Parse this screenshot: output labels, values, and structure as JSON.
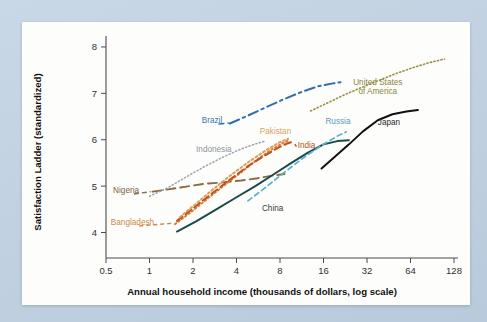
{
  "figure": {
    "background_color": "#c3d3e3",
    "card_color": "#fdfdfc"
  },
  "chart_data": {
    "type": "line",
    "title": "",
    "subtitle": "",
    "xlabel": "Annual household income (thousands of dollars, log scale)",
    "ylabel": "Satisfaction Ladder (standardized)",
    "xscale": "log2",
    "xticks": [
      "0.5",
      "1",
      "2",
      "4",
      "8",
      "16",
      "32",
      "64",
      "128"
    ],
    "xtick_values": [
      0.5,
      1,
      2,
      4,
      8,
      16,
      32,
      64,
      128
    ],
    "yticks": [
      "4",
      "5",
      "6",
      "7",
      "8"
    ],
    "ytick_values": [
      4,
      5,
      6,
      7,
      8
    ],
    "xlim": [
      0.5,
      128
    ],
    "ylim": [
      3.45,
      8.15
    ],
    "grid": false,
    "legend_position": "inline-annotations",
    "series": [
      {
        "name": "Nigeria",
        "label": "Nigeria",
        "color": "#8a6a45",
        "label_color": "#7b5f3e",
        "dash": "9 5",
        "width": 1.9,
        "x": [
          1.05,
          1.35,
          1.8,
          2.4,
          3.2,
          4.3,
          5.6,
          7.2,
          8.6
        ],
        "y": [
          4.88,
          4.93,
          4.99,
          5.05,
          5.08,
          5.12,
          5.17,
          5.23,
          5.26
        ],
        "label_x": 0.56,
        "label_y": 4.86
      },
      {
        "name": "Bangladesh",
        "label": "Bangladesh",
        "color": "#d4833a",
        "label_color": "#c98a44",
        "dash": "1.6 2.6",
        "width": 2.0,
        "x": [
          1.5,
          1.9,
          2.5,
          3.3,
          4.4,
          5.6,
          7.0,
          8.4,
          9.3
        ],
        "y": [
          4.18,
          4.42,
          4.72,
          5.02,
          5.32,
          5.58,
          5.79,
          5.93,
          5.99
        ],
        "label_x": 0.54,
        "label_y": 4.17
      },
      {
        "name": "India",
        "label": "India",
        "color": "#c0501f",
        "label_color": "#c0501f",
        "dash": "7 4",
        "width": 2.0,
        "x": [
          1.55,
          2.0,
          2.7,
          3.6,
          4.8,
          6.2,
          7.8,
          9.0,
          9.8
        ],
        "y": [
          4.25,
          4.52,
          4.84,
          5.14,
          5.43,
          5.65,
          5.83,
          5.92,
          5.96
        ],
        "label_x": 10.6,
        "label_y": 5.83
      },
      {
        "name": "Pakistan",
        "label": "Pakistan",
        "color": "#e09a54",
        "label_color": "#e0a05c",
        "dash": "2 2.6",
        "width": 2.0,
        "x": [
          1.62,
          2.1,
          2.8,
          3.7,
          4.9,
          6.3,
          7.9,
          9.1
        ],
        "y": [
          4.33,
          4.62,
          4.95,
          5.25,
          5.53,
          5.76,
          5.94,
          6.02
        ],
        "label_x": 5.8,
        "label_y": 6.13
      },
      {
        "name": "Indonesia",
        "label": "Indonesia",
        "color": "#9aa3ae",
        "label_color": "#8a93a0",
        "dash": "1.2 2.4",
        "width": 1.5,
        "x": [
          1.0,
          1.35,
          1.8,
          2.4,
          3.2,
          4.3,
          5.4,
          6.3
        ],
        "y": [
          4.78,
          4.97,
          5.2,
          5.42,
          5.62,
          5.8,
          5.91,
          5.97
        ],
        "label_x": 2.1,
        "label_y": 5.74
      },
      {
        "name": "China",
        "label": "China",
        "color": "#1c4a4a",
        "label_color": "#3a3a3a",
        "dash": "none",
        "width": 2.0,
        "x": [
          1.55,
          2.1,
          2.9,
          4.0,
          5.4,
          7.2,
          9.6,
          12.5,
          16.0,
          20.0,
          24.0
        ],
        "y": [
          4.02,
          4.24,
          4.5,
          4.76,
          5.0,
          5.25,
          5.5,
          5.72,
          5.9,
          5.97,
          5.99
        ],
        "label_x": 6.0,
        "label_y": 4.47
      },
      {
        "name": "Russia",
        "label": "Russia",
        "color": "#5fb0c8",
        "label_color": "#4f9fbd",
        "dash": "5 3.5",
        "width": 1.7,
        "x": [
          4.8,
          6.4,
          8.6,
          11.5,
          15.4,
          20.0,
          23.0
        ],
        "y": [
          4.68,
          4.98,
          5.3,
          5.6,
          5.87,
          6.08,
          6.17
        ],
        "label_x": 16.5,
        "label_y": 6.33
      },
      {
        "name": "Brazil",
        "label": "Brazil",
        "color": "#2f6fae",
        "label_color": "#3b76b0",
        "dash": "10 4 2.5 4",
        "width": 2.0,
        "x": [
          3.6,
          4.8,
          6.4,
          8.6,
          11.5,
          15.0,
          19.0,
          21.0
        ],
        "y": [
          6.35,
          6.52,
          6.7,
          6.88,
          7.04,
          7.16,
          7.22,
          7.24
        ],
        "label_x": 2.3,
        "label_y": 6.37
      },
      {
        "name": "Japan",
        "label": "Japan",
        "color": "#111111",
        "label_color": "#2a2a2a",
        "dash": "none",
        "width": 2.0,
        "x": [
          15.5,
          19.0,
          24.0,
          30.0,
          38.0,
          48.0,
          60.0,
          72.0
        ],
        "y": [
          5.38,
          5.62,
          5.9,
          6.18,
          6.42,
          6.55,
          6.61,
          6.64
        ],
        "label_x": 38.0,
        "label_y": 6.32
      },
      {
        "name": "United States of America",
        "label": "United States\nof America",
        "label_line1": "United States",
        "label_line2": "of America",
        "color": "#9a8f3e",
        "label_color": "#8c8440",
        "dash": "1.2 2.4",
        "width": 1.6,
        "x": [
          13.0,
          17.0,
          22.0,
          29.0,
          38.0,
          50.0,
          66.0,
          86.0,
          110.0
        ],
        "y": [
          6.62,
          6.79,
          6.96,
          7.12,
          7.27,
          7.42,
          7.55,
          7.66,
          7.74
        ],
        "label_x": 38.0,
        "label_y": 7.18
      }
    ]
  }
}
